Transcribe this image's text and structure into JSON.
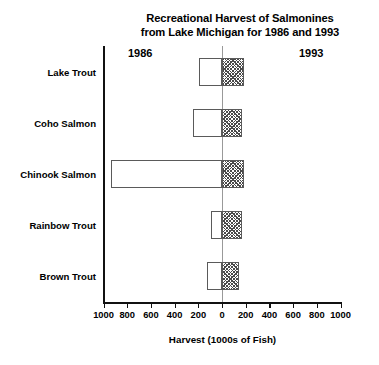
{
  "chart_data": {
    "type": "bar",
    "orientation": "horizontal",
    "subtype": "bidirectional-paired-bars",
    "title": "Recreational Harvest of Salmonines from Lake Michigan for 1986 and 1993",
    "title_lines": [
      "Recreational Harvest of Salmonines",
      "from Lake Michigan for 1986 and 1993"
    ],
    "xlabel": "Harvest (1000s of Fish)",
    "ylabel": "",
    "categories": [
      "Lake Trout",
      "Coho Salmon",
      "Chinook Salmon",
      "Rainbow Trout",
      "Brown Trout"
    ],
    "series": [
      {
        "name": "1986",
        "direction": "left",
        "fill": "white",
        "values": [
          195,
          245,
          940,
          90,
          125
        ]
      },
      {
        "name": "1993",
        "direction": "right",
        "fill": "hatched",
        "values": [
          185,
          170,
          185,
          170,
          145
        ]
      }
    ],
    "axis_left_label": "1986",
    "axis_right_label": "1993",
    "xlim": [
      -1000,
      1000
    ],
    "x_tick_values": [
      -1000,
      -800,
      -600,
      -400,
      -200,
      0,
      200,
      400,
      600,
      800,
      1000
    ],
    "x_tick_labels": [
      "1000",
      "800",
      "600",
      "400",
      "200",
      "0",
      "200",
      "400",
      "600",
      "800",
      "1000"
    ],
    "grid": false,
    "legend": "none",
    "zero_reference_line": true,
    "units": "thousands of fish",
    "colors": {
      "axis": "#111111",
      "zero_line": "#999999",
      "bar_outline": "#5a5a5a",
      "bar_1986_fill": "#ffffff",
      "bar_1993_hatch": "#4a4a4a",
      "text": "#000000",
      "background": "#ffffff"
    }
  }
}
